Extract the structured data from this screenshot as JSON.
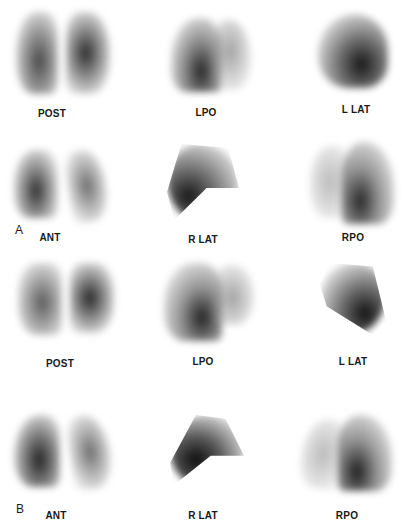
{
  "figure": {
    "panels": [
      {
        "letter": "A",
        "views": [
          {
            "label": "POST"
          },
          {
            "label": "LPO"
          },
          {
            "label": "L LAT"
          },
          {
            "label": "ANT"
          },
          {
            "label": "R LAT"
          },
          {
            "label": "RPO"
          }
        ]
      },
      {
        "letter": "B",
        "views": [
          {
            "label": "POST"
          },
          {
            "label": "LPO"
          },
          {
            "label": "L LAT"
          },
          {
            "label": "ANT"
          },
          {
            "label": "R LAT"
          },
          {
            "label": "RPO"
          }
        ]
      }
    ]
  }
}
